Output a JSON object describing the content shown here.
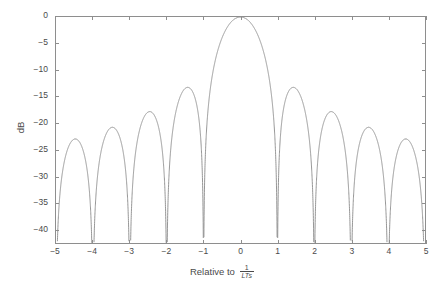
{
  "chart_data": {
    "type": "line",
    "title": "",
    "xlabel": "Relative to 1/(LTs)",
    "xlabel_text": "Relative to",
    "xlabel_fraction_numerator": "1",
    "xlabel_fraction_denominator": "LTs",
    "ylabel": "dB",
    "xlim": [
      -5,
      5
    ],
    "ylim": [
      -42.6,
      0
    ],
    "xticks": [
      -5,
      -4,
      -3,
      -2,
      -1,
      0,
      1,
      2,
      3,
      4,
      5
    ],
    "xtick_labels": [
      "-5",
      "-4",
      "-3",
      "-2",
      "-1",
      "0",
      "1",
      "2",
      "3",
      "4",
      "5"
    ],
    "yticks": [
      0,
      -5,
      -10,
      -15,
      -20,
      -25,
      -30,
      -35,
      -40
    ],
    "ytick_labels": [
      "0",
      "-5",
      "-10",
      "-15",
      "-20",
      "-25",
      "-30",
      "-35",
      "-40"
    ],
    "grid": false,
    "legend": false,
    "series": [
      {
        "name": "sinc spectrum",
        "formula": "20*log10(abs(sin(pi*x)/(pi*x)))",
        "color": "#8a8a8a",
        "line_width": 0.8,
        "nulls": [
          -5,
          -4,
          -3,
          -2,
          -1,
          1,
          2,
          3,
          4,
          5
        ],
        "peaks": [
          {
            "x": 0.0,
            "y": 0.0
          },
          {
            "x": 1.43,
            "y": -13.26
          },
          {
            "x": -1.43,
            "y": -13.26
          },
          {
            "x": 2.46,
            "y": -17.83
          },
          {
            "x": -2.46,
            "y": -17.83
          },
          {
            "x": 3.47,
            "y": -20.8
          },
          {
            "x": -3.47,
            "y": -20.8
          },
          {
            "x": 4.48,
            "y": -22.99
          },
          {
            "x": -4.48,
            "y": -22.99
          }
        ]
      }
    ]
  },
  "axes": {
    "frame_color": "#8e8e8e",
    "tick_color": "#8e8e8e",
    "text_color": "#4a4a4a",
    "background": "#ffffff"
  }
}
